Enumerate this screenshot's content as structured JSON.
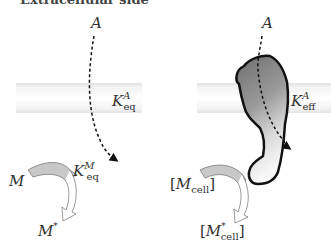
{
  "title": "Extracellular side",
  "colors": {
    "membrane": "#e6e6e6",
    "protein_dark": "#7a7a7a",
    "protein_light": "#f2f2f2",
    "outline": "#111111",
    "arrow_fill": "#c8c8c8",
    "text": "#333333"
  },
  "left_panel": {
    "ligand_label": "A",
    "membrane_constant": {
      "base": "K",
      "sup": "A",
      "sub": "eq"
    },
    "reaction_constant": {
      "base": "K",
      "sup": "M",
      "sub": "eq"
    },
    "reactant": "M",
    "product": {
      "base": "M",
      "sup": "*"
    }
  },
  "right_panel": {
    "ligand_label": "A",
    "membrane_constant": {
      "base": "K",
      "sup": "A",
      "sub": "eff"
    },
    "reactant": {
      "open": "[",
      "base": "M",
      "sub": "cell",
      "close": "]"
    },
    "product": {
      "open": "[",
      "base": "M",
      "sup": "*",
      "sub": "cell",
      "close": "]"
    }
  }
}
